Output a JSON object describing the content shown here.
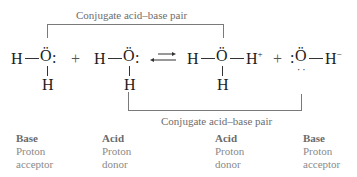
{
  "figure": {
    "top_bracket_label": "Conjugate acid–base pair",
    "bottom_bracket_label": "Conjugate acid–base pair",
    "equation": {
      "species": [
        {
          "formula": "H2O",
          "role_index": 0
        },
        {
          "formula": "H2O",
          "role_index": 1
        },
        {
          "formula": "H3O+",
          "role_index": 2
        },
        {
          "formula": "OH-",
          "role_index": 3
        }
      ],
      "plus_sign": "+",
      "equilibrium_arrow": "⇌",
      "atoms": {
        "H": "H",
        "O_two_lone_pairs_top": "Ö",
        "colon": ":",
        "hydronium_charge": "+",
        "hydroxide_charge": "−"
      }
    },
    "roles": [
      {
        "title": "Base",
        "line1": "Proton",
        "line2": "acceptor"
      },
      {
        "title": "Acid",
        "line1": "Proton",
        "line2": "donor"
      },
      {
        "title": "Acid",
        "line1": "Proton",
        "line2": "donor"
      },
      {
        "title": "Base",
        "line1": "Proton",
        "line2": "acceptor"
      }
    ],
    "colors": {
      "bracket": "#7a7a7a",
      "text": "#1c1c1c",
      "caption": "#6d6d6d",
      "role": "#8a8a8a"
    }
  }
}
